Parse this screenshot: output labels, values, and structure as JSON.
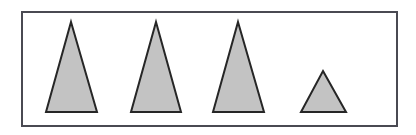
{
  "figure": {
    "canvas": {
      "width": 416,
      "height": 135,
      "background": "#ffffff"
    },
    "frame": {
      "name": "outer-rectangle-border",
      "x": 21,
      "y": 11,
      "width": 377,
      "height": 116,
      "stroke": "#4a4a52",
      "stroke_width": 2,
      "fill": "#ffffff"
    },
    "style": {
      "shape_fill": "#c3c3c3",
      "shape_stroke": "#262626",
      "shape_stroke_width": 2
    },
    "shape_count": 4,
    "shapes": [
      {
        "index": 1,
        "label": "Triangle 1",
        "kind": "triangle",
        "apex": {
          "x": 71,
          "y": 22
        },
        "base_left": {
          "x": 46,
          "y": 112
        },
        "base_right": {
          "x": 97,
          "y": 112
        },
        "base_width": 51,
        "height": 90,
        "size": "tall"
      },
      {
        "index": 2,
        "label": "Triangle 2",
        "kind": "triangle",
        "apex": {
          "x": 156,
          "y": 22
        },
        "base_left": {
          "x": 131,
          "y": 112
        },
        "base_right": {
          "x": 181,
          "y": 112
        },
        "base_width": 50,
        "height": 90,
        "size": "tall"
      },
      {
        "index": 3,
        "label": "Triangle 3",
        "kind": "triangle",
        "apex": {
          "x": 238,
          "y": 22
        },
        "base_left": {
          "x": 213,
          "y": 112
        },
        "base_right": {
          "x": 264,
          "y": 112
        },
        "base_width": 51,
        "height": 90,
        "size": "tall"
      },
      {
        "index": 4,
        "label": "Triangle 4",
        "kind": "triangle",
        "apex": {
          "x": 323,
          "y": 71
        },
        "base_left": {
          "x": 301,
          "y": 112
        },
        "base_right": {
          "x": 346,
          "y": 112
        },
        "base_width": 45,
        "height": 41,
        "size": "small"
      }
    ]
  }
}
